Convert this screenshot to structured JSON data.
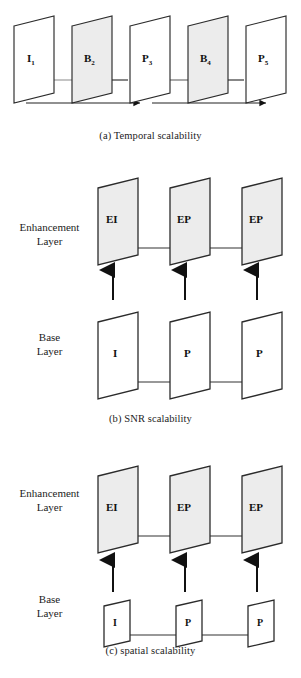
{
  "figure": {
    "colors": {
      "stroke": "#2b2b2b",
      "plane_fill_shaded": "#ececec",
      "plane_fill_plain": "#ffffff",
      "arrow_dark": "#111111",
      "arrow_gray": "#8a8a8a",
      "text": "#1c1c1c"
    }
  },
  "panels": [
    {
      "id": "a",
      "caption": "(a) Temporal scalability",
      "frames": [
        {
          "label": "I",
          "subscript": "1",
          "shaded": false
        },
        {
          "label": "B",
          "subscript": "2",
          "shaded": true
        },
        {
          "label": "P",
          "subscript": "3",
          "shaded": false
        },
        {
          "label": "B",
          "subscript": "4",
          "shaded": true
        },
        {
          "label": "P",
          "subscript": "5",
          "shaded": false
        }
      ],
      "prediction_arrows": [
        {
          "from": "I1",
          "to": "B2",
          "direction": "right"
        },
        {
          "from": "P3",
          "to": "B2",
          "direction": "left"
        },
        {
          "from": "P3",
          "to": "B4",
          "direction": "right"
        },
        {
          "from": "P5",
          "to": "B4",
          "direction": "left"
        }
      ],
      "base_arrows": [
        {
          "from": "I1",
          "to": "P3",
          "direction": "right"
        },
        {
          "from": "P3",
          "to": "P5",
          "direction": "right"
        }
      ]
    },
    {
      "id": "b",
      "caption": "(b) SNR scalability",
      "enhancement_label": "Enhancement\nLayer",
      "enhancement_label_line1": "Enhancement",
      "enhancement_label_line2": "Layer",
      "base_label_line1": "Base",
      "base_label_line2": "Layer",
      "enhancement_frames": [
        {
          "label": "EI",
          "shaded": true
        },
        {
          "label": "EP",
          "shaded": true
        },
        {
          "label": "EP",
          "shaded": true
        }
      ],
      "base_frames": [
        {
          "label": "I",
          "shaded": false
        },
        {
          "label": "P",
          "shaded": false
        },
        {
          "label": "P",
          "shaded": false
        }
      ],
      "uplink_arrows": 3,
      "base_frame_size": "same"
    },
    {
      "id": "c",
      "caption": "(c) spatial scalability",
      "enhancement_label_line1": "Enhancement",
      "enhancement_label_line2": "Layer",
      "base_label_line1": "Base",
      "base_label_line2": "Layer",
      "enhancement_frames": [
        {
          "label": "EI",
          "shaded": true
        },
        {
          "label": "EP",
          "shaded": true
        },
        {
          "label": "EP",
          "shaded": true
        }
      ],
      "base_frames": [
        {
          "label": "I",
          "shaded": false
        },
        {
          "label": "P",
          "shaded": false
        },
        {
          "label": "P",
          "shaded": false
        }
      ],
      "uplink_arrows": 3,
      "base_frame_size": "small"
    }
  ]
}
